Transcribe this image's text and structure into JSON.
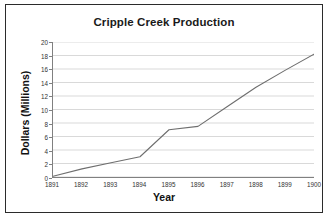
{
  "chart_data": {
    "type": "line",
    "title": "Cripple Creek Production",
    "xlabel": "Year",
    "ylabel": "Dollars (Millions)",
    "categories": [
      "1891",
      "1892",
      "1893",
      "1894",
      "1895",
      "1896",
      "1897",
      "1898",
      "1899",
      "1900"
    ],
    "x": [
      1891,
      1892,
      1893,
      1894,
      1895,
      1896,
      1897,
      1898,
      1899,
      1900
    ],
    "values": [
      0.1,
      1.2,
      2.1,
      3.0,
      7.0,
      7.5,
      10.4,
      13.3,
      15.8,
      18.2
    ],
    "series": [
      {
        "name": "Production",
        "values": [
          0.1,
          1.2,
          2.1,
          3.0,
          7.0,
          7.5,
          10.4,
          13.3,
          15.8,
          18.2
        ]
      }
    ],
    "ylim": [
      0,
      20
    ],
    "yticks": [
      0,
      2,
      4,
      6,
      8,
      10,
      12,
      14,
      16,
      18,
      20
    ],
    "ytick_labels": [
      "0",
      "2",
      "4",
      "6",
      "8",
      "10",
      "12",
      "14",
      "16",
      "18",
      "20"
    ],
    "xlim": [
      1891,
      1900
    ],
    "grid": "horizontal",
    "legend": "none",
    "line_color": "#6e6e6e",
    "grid_color": "#c8c8c8",
    "axis_color": "#808080",
    "background": "#ffffff",
    "border_color": "#2b2b2b"
  }
}
